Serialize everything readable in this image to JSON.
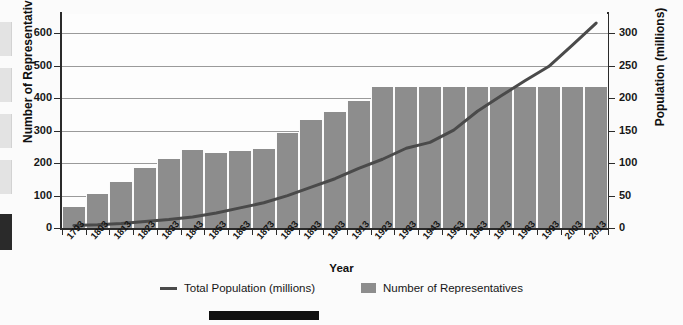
{
  "chart_data": {
    "type": "bar",
    "title": "",
    "xlabel": "Year",
    "ylabel": "Number of Representatives",
    "y2label": "Population (millions)",
    "ylim": [
      0,
      660
    ],
    "y2lim": [
      0,
      330
    ],
    "yticks": [
      0,
      100,
      200,
      300,
      400,
      500,
      600
    ],
    "y2ticks": [
      0,
      50,
      100,
      150,
      200,
      250,
      300
    ],
    "grid": true,
    "legend_position": "bottom",
    "categories": [
      "1793",
      "1803",
      "1813",
      "1823",
      "1833",
      "1843",
      "1853",
      "1863",
      "1873",
      "1883",
      "1893",
      "1903",
      "1913",
      "1923",
      "1933",
      "1943",
      "1953",
      "1963",
      "1973",
      "1983",
      "1993",
      "2003",
      "2013"
    ],
    "series": [
      {
        "name": "Number of Representatives",
        "type": "bar",
        "axis": "left",
        "color": "#8d8d8d",
        "values": [
          65,
          106,
          142,
          186,
          213,
          242,
          232,
          237,
          243,
          293,
          332,
          357,
          391,
          435,
          435,
          435,
          435,
          435,
          435,
          435,
          435,
          435,
          435
        ]
      },
      {
        "name": "Total Population (millions)",
        "type": "line",
        "axis": "right",
        "color": "#4a4a4a",
        "values": [
          4,
          5,
          7,
          10,
          13,
          17,
          23,
          31,
          39,
          50,
          63,
          76,
          92,
          106,
          123,
          132,
          151,
          180,
          204,
          227,
          249,
          282,
          316
        ]
      }
    ]
  },
  "axes": {
    "y_left_title": "Number of Representatives",
    "y_right_title": "Population (millions)",
    "x_title": "Year"
  },
  "legend": {
    "items": [
      {
        "label": "Total Population (millions)",
        "marker": "line-marker"
      },
      {
        "label": "Number of Representatives",
        "marker": "box-marker"
      }
    ]
  },
  "colors": {
    "bar": "#8d8d8d",
    "line": "#4a4a4a",
    "grid": "#9a9a9a",
    "axis": "#2b2b2b",
    "background": "#fbfbfb"
  }
}
